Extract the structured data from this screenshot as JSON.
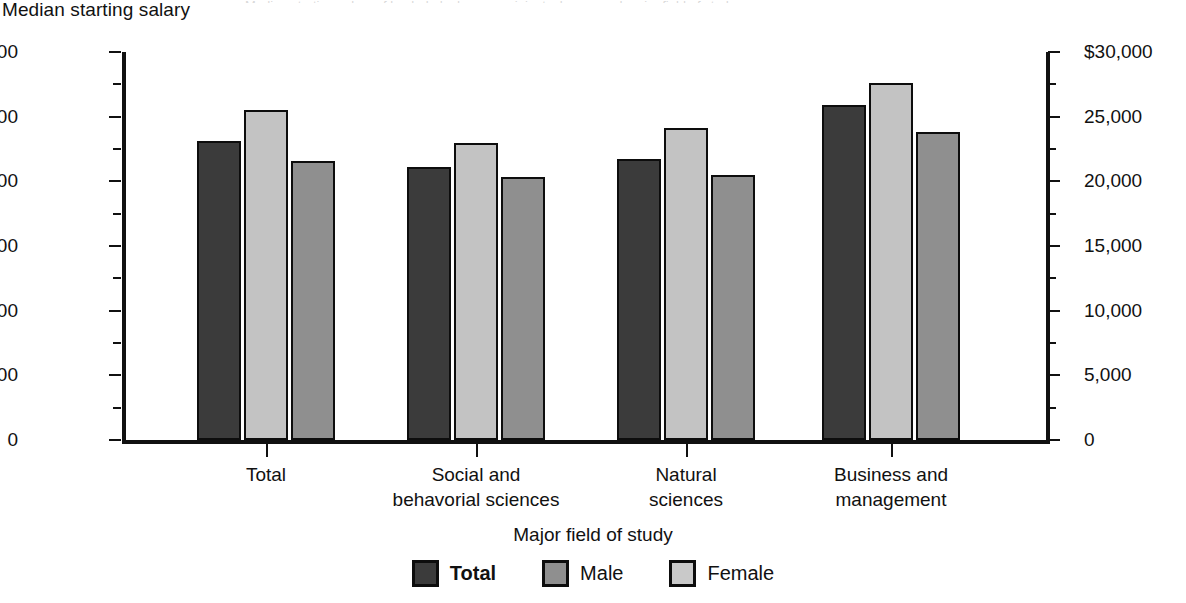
{
  "ytitle": "Median starting salary",
  "xtitle": "Major field of study",
  "top_sliver": "Median starting salary of bachelor's degree recipients, by sex and major field of study",
  "legend": [
    {
      "label": "Total",
      "swatch": "#3b3b3b"
    },
    {
      "label": "Male",
      "swatch": "#8f8f8f"
    },
    {
      "label": "Female",
      "swatch": "#c9c9c9"
    }
  ],
  "yticks": [
    "$30,000",
    "25,000",
    "20,000",
    "15,000",
    "10,000",
    "5,000",
    "0"
  ],
  "categories": [
    {
      "line1": "Total",
      "line2": ""
    },
    {
      "line1": "Social and",
      "line2": "behavorial sciences"
    },
    {
      "line1": "Natural",
      "line2": "sciences"
    },
    {
      "line1": "Business and",
      "line2": "management"
    }
  ],
  "chart_data": {
    "type": "bar",
    "title": "Median starting salary of bachelor's degree recipients, by sex and major field of study",
    "xlabel": "Major field of study",
    "ylabel": "Median starting salary",
    "ylim": [
      0,
      30000
    ],
    "ytick_values": [
      30000,
      25000,
      20000,
      15000,
      10000,
      5000,
      0
    ],
    "ytick_labels": [
      "$30,000",
      "25,000",
      "20,000",
      "15,000",
      "10,000",
      "5,000",
      "0"
    ],
    "minor_tick_interval": 2500,
    "dual_axis": true,
    "grid": false,
    "legend_position": "bottom",
    "categories": [
      "Total",
      "Social and behavorial sciences",
      "Natural sciences",
      "Business and management"
    ],
    "series": [
      {
        "name": "Total",
        "color": "#3b3b3b",
        "values": [
          23100,
          21100,
          21700,
          25900
        ]
      },
      {
        "name": "Male",
        "color": "#c3c3c3",
        "values": [
          25500,
          23000,
          24100,
          27600
        ]
      },
      {
        "name": "Female",
        "color": "#8f8f8f",
        "values": [
          21600,
          20300,
          20500,
          23800
        ]
      }
    ]
  }
}
